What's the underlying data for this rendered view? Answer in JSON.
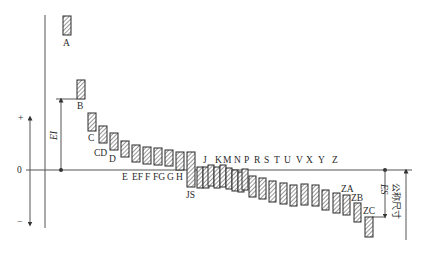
{
  "diagram": {
    "title": "",
    "axis": {
      "zero_label": "0",
      "plus_label": "+",
      "minus_label": "−",
      "ei_label": "EI",
      "es_label": "ES",
      "nominal_size_label": "公称尺寸"
    },
    "bars": [
      {
        "label": "A",
        "x": 63,
        "y1": 16,
        "y2": 35,
        "w": 8
      },
      {
        "label": "B",
        "x": 77,
        "y1": 80,
        "y2": 99,
        "w": 8
      },
      {
        "label": "C",
        "x": 88,
        "y1": 113,
        "y2": 131,
        "w": 8
      },
      {
        "label": "CD",
        "x": 99,
        "y1": 126,
        "y2": 143,
        "w": 8
      },
      {
        "label": "D",
        "x": 110,
        "y1": 133,
        "y2": 150,
        "w": 8
      },
      {
        "label": "E",
        "x": 121,
        "y1": 141,
        "y2": 157,
        "w": 8
      },
      {
        "label": "EF",
        "x": 132,
        "y1": 145,
        "y2": 162,
        "w": 8
      },
      {
        "label": "F",
        "x": 143,
        "y1": 147,
        "y2": 164,
        "w": 8
      },
      {
        "label": "FG",
        "x": 154,
        "y1": 148,
        "y2": 165,
        "w": 8
      },
      {
        "label": "G",
        "x": 165,
        "y1": 150,
        "y2": 166,
        "w": 8
      },
      {
        "label": "H",
        "x": 176,
        "y1": 152,
        "y2": 170,
        "w": 8
      },
      {
        "label": "JS",
        "x": 187,
        "y1": 152,
        "y2": 187,
        "w": 8
      },
      {
        "label": "J",
        "x": 197,
        "y1": 167,
        "y2": 188,
        "w": 6
      },
      {
        "label": "J2",
        "x": 203,
        "y1": 167,
        "y2": 188,
        "w": 6
      },
      {
        "label": "K",
        "x": 208,
        "y1": 165,
        "y2": 186,
        "w": 6
      },
      {
        "label": "K2",
        "x": 214,
        "y1": 167,
        "y2": 188,
        "w": 6
      },
      {
        "label": "M",
        "x": 220,
        "y1": 165,
        "y2": 187,
        "w": 6
      },
      {
        "label": "M2",
        "x": 226,
        "y1": 168,
        "y2": 189,
        "w": 6
      },
      {
        "label": "N",
        "x": 232,
        "y1": 170,
        "y2": 191,
        "w": 6
      },
      {
        "label": "N2",
        "x": 238,
        "y1": 172,
        "y2": 192,
        "w": 6
      },
      {
        "label": "P",
        "x": 242,
        "y1": 169,
        "y2": 190,
        "w": 6
      },
      {
        "label": "R",
        "x": 249,
        "y1": 176,
        "y2": 197,
        "w": 7
      },
      {
        "label": "S",
        "x": 259,
        "y1": 178,
        "y2": 199,
        "w": 7
      },
      {
        "label": "T",
        "x": 269,
        "y1": 181,
        "y2": 202,
        "w": 7
      },
      {
        "label": "U",
        "x": 280,
        "y1": 183,
        "y2": 204,
        "w": 7
      },
      {
        "label": "V",
        "x": 290,
        "y1": 185,
        "y2": 206,
        "w": 7
      },
      {
        "label": "X",
        "x": 301,
        "y1": 184,
        "y2": 205,
        "w": 7
      },
      {
        "label": "Y",
        "x": 312,
        "y1": 185,
        "y2": 206,
        "w": 7
      },
      {
        "label": "Z",
        "x": 322,
        "y1": 190,
        "y2": 210,
        "w": 7
      },
      {
        "label": "Z2",
        "x": 333,
        "y1": 193,
        "y2": 213,
        "w": 7
      },
      {
        "label": "ZA",
        "x": 343,
        "y1": 195,
        "y2": 215,
        "w": 7
      },
      {
        "label": "ZB",
        "x": 354,
        "y1": 203,
        "y2": 222,
        "w": 7
      },
      {
        "label": "ZC",
        "x": 365,
        "y1": 217,
        "y2": 237,
        "w": 8
      }
    ],
    "labels": [
      {
        "text": "A",
        "x": 63,
        "y": 46
      },
      {
        "text": "B",
        "x": 77,
        "y": 109
      },
      {
        "text": "C",
        "x": 88,
        "y": 141
      },
      {
        "text": "CD",
        "x": 94,
        "y": 156
      },
      {
        "text": "D",
        "x": 109,
        "y": 162
      },
      {
        "text": "E",
        "x": 122,
        "y": 180
      },
      {
        "text": "EF",
        "x": 132,
        "y": 180
      },
      {
        "text": "F",
        "x": 145,
        "y": 180
      },
      {
        "text": "FG",
        "x": 153,
        "y": 180
      },
      {
        "text": "G",
        "x": 167,
        "y": 180
      },
      {
        "text": "H",
        "x": 176,
        "y": 180
      },
      {
        "text": "JS",
        "x": 186,
        "y": 198
      },
      {
        "text": "J",
        "x": 203,
        "y": 163
      },
      {
        "text": "K",
        "x": 215,
        "y": 163
      },
      {
        "text": "M",
        "x": 223,
        "y": 163
      },
      {
        "text": "N",
        "x": 234,
        "y": 163
      },
      {
        "text": "P",
        "x": 244,
        "y": 163
      },
      {
        "text": "R",
        "x": 254,
        "y": 163
      },
      {
        "text": "S",
        "x": 264,
        "y": 163
      },
      {
        "text": "T",
        "x": 274,
        "y": 163
      },
      {
        "text": "U",
        "x": 284,
        "y": 163
      },
      {
        "text": "V",
        "x": 296,
        "y": 163
      },
      {
        "text": "X",
        "x": 306,
        "y": 163
      },
      {
        "text": "Y",
        "x": 318,
        "y": 163
      },
      {
        "text": "Z",
        "x": 332,
        "y": 163
      },
      {
        "text": "ZA",
        "x": 341,
        "y": 192
      },
      {
        "text": "ZB",
        "x": 351,
        "y": 201
      },
      {
        "text": "ZC",
        "x": 363,
        "y": 214
      }
    ]
  }
}
